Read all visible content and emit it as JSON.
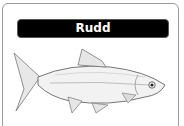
{
  "card": {
    "title": "Rudd",
    "image": {
      "icon": "rudd-fish-illustration"
    }
  }
}
